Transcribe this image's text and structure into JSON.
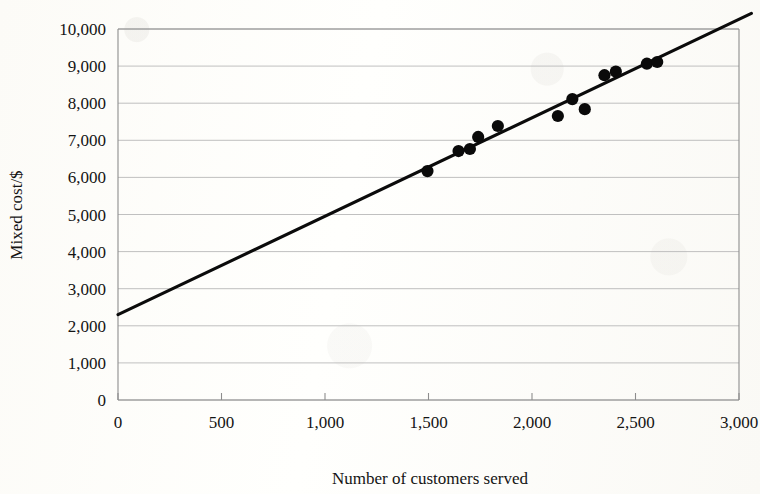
{
  "chart_data": {
    "type": "scatter",
    "title": "",
    "xlabel": "Number of customers served",
    "ylabel": "Mixed cost/$",
    "xlim": [
      0,
      3000
    ],
    "ylim": [
      0,
      10000
    ],
    "grid": true,
    "legend_position": "none",
    "x_ticks": [
      "0",
      "500",
      "1,000",
      "1,500",
      "2,000",
      "2,500",
      "3,000"
    ],
    "x_tick_values": [
      0,
      500,
      1000,
      1500,
      2000,
      2500,
      3000
    ],
    "y_ticks": [
      "0",
      "1,000",
      "2,000",
      "3,000",
      "4,000",
      "5,000",
      "6,000",
      "7,000",
      "8,000",
      "9,000",
      "10,000"
    ],
    "y_tick_values": [
      0,
      1000,
      2000,
      3000,
      4000,
      5000,
      6000,
      7000,
      8000,
      9000,
      10000
    ],
    "series": [
      {
        "name": "Mixed cost observations",
        "marker": "filled-circle",
        "color": "#0a0a0a",
        "points": [
          {
            "x": 1495,
            "y": 6170
          },
          {
            "x": 1645,
            "y": 6710
          },
          {
            "x": 1700,
            "y": 6765
          },
          {
            "x": 1740,
            "y": 7090
          },
          {
            "x": 1835,
            "y": 7385
          },
          {
            "x": 2125,
            "y": 7655
          },
          {
            "x": 2195,
            "y": 8110
          },
          {
            "x": 2255,
            "y": 7840
          },
          {
            "x": 2350,
            "y": 8755
          },
          {
            "x": 2405,
            "y": 8850
          },
          {
            "x": 2555,
            "y": 9065
          },
          {
            "x": 2605,
            "y": 9110
          }
        ]
      }
    ],
    "trendline": {
      "name": "Line of best fit",
      "color": "#0b0b0b",
      "intercept": 2300,
      "slope": 2.65,
      "x_start": 0,
      "y_start": 2300,
      "x_end": 3060,
      "y_end": 10420
    }
  }
}
